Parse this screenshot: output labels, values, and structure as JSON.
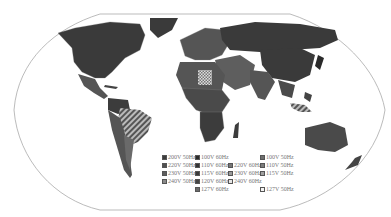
{
  "map": {
    "title": "World mains voltage and frequency",
    "projection": "Robinson"
  },
  "legend": {
    "items": [
      {
        "label": "200V 50Hz",
        "color": "#3c3c3c",
        "col": 0,
        "row": 0
      },
      {
        "label": "220V 50Hz",
        "color": "#505050",
        "col": 0,
        "row": 1
      },
      {
        "label": "230V 50Hz",
        "color": "#5e5e5e",
        "col": 0,
        "row": 2
      },
      {
        "label": "240V 50Hz",
        "color": "#8a8a8a",
        "col": 0,
        "row": 3
      },
      {
        "label": "100V 60Hz",
        "color": "#2a2a2a",
        "col": 1,
        "row": 0
      },
      {
        "label": "110V 60Hz",
        "color": "#333333",
        "col": 1,
        "row": 1
      },
      {
        "label": "115V 60Hz",
        "color": "#3a3a3a",
        "col": 1,
        "row": 2
      },
      {
        "label": "120V 60Hz",
        "color": "#444444",
        "col": 1,
        "row": 3
      },
      {
        "label": "127V 60Hz",
        "color": "#6a6a6a",
        "col": 1,
        "row": 4
      },
      {
        "label": "220V 60Hz",
        "color": "#777777",
        "col": 2,
        "row": 1
      },
      {
        "label": "230V 60Hz",
        "color": "#9a9a9a",
        "col": 2,
        "row": 2
      },
      {
        "label": "240V 60Hz",
        "color": "#e6e6e6",
        "col": 2,
        "row": 3
      },
      {
        "label": "100V 50Hz",
        "color": "#6e6e6e",
        "col": 3,
        "row": 0
      },
      {
        "label": "110V 50Hz",
        "color": "#7c7c7c",
        "col": 3,
        "row": 1
      },
      {
        "label": "115V 50Hz",
        "color": "#a0a0a0",
        "col": 3,
        "row": 2
      },
      {
        "label": "127V 50Hz",
        "color": "#f4f4f4",
        "col": 3,
        "row": 4
      }
    ]
  }
}
